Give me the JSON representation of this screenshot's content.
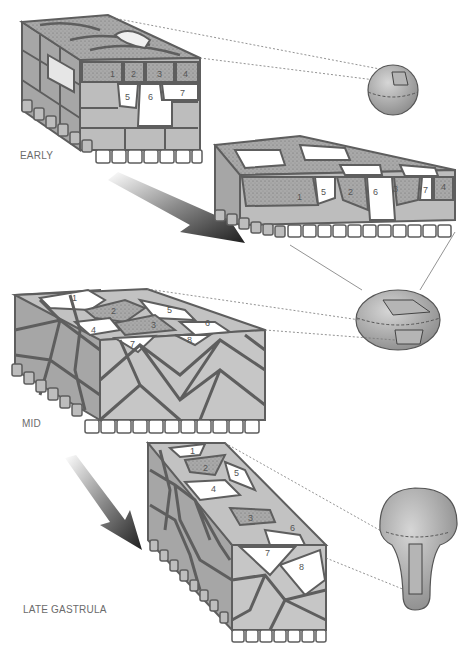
{
  "diagram": {
    "stages": [
      {
        "id": "early",
        "label": "EARLY"
      },
      {
        "id": "mid",
        "label": "MID"
      },
      {
        "id": "late",
        "label": "LATE GASTRULA"
      }
    ],
    "early_block_cells": [
      "1",
      "2",
      "3",
      "4",
      "5",
      "6",
      "7"
    ],
    "early_block2_cells": [
      "1",
      "5",
      "2",
      "6",
      "3",
      "7",
      "4"
    ],
    "mid_block_cells": [
      "1",
      "2",
      "3",
      "4",
      "5",
      "6",
      "7",
      "8"
    ],
    "late_block_cells": [
      "1",
      "2",
      "3",
      "4",
      "5",
      "6",
      "7",
      "8"
    ],
    "embryo_icons": [
      {
        "id": "sphere",
        "stage": "early"
      },
      {
        "id": "oval",
        "stage": "mid"
      },
      {
        "id": "mushroom",
        "stage": "late"
      }
    ],
    "colors": {
      "cell_light": "#c9c9c9",
      "cell_mid": "#b0b0b0",
      "cell_dark": "#9a9a9a",
      "cell_border": "#5e5e5e",
      "cell_white": "#ffffff",
      "label_text": "#6b6b6b",
      "arrow_dark": "#2a2a2a"
    }
  }
}
